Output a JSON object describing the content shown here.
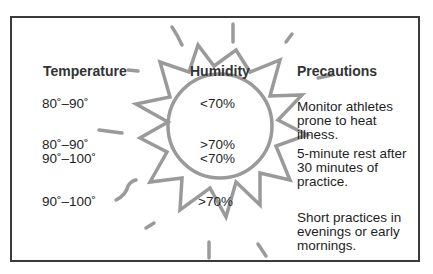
{
  "headers": {
    "temperature": "Temperature",
    "humidity": "Humidity",
    "precautions": "Precautions"
  },
  "rows": [
    {
      "temperature": [
        "80˚–90˚"
      ],
      "humidity": [
        "<70%"
      ],
      "precaution": [
        "Monitor athletes",
        "prone to heat",
        "illness."
      ]
    },
    {
      "temperature": [
        "80˚–90˚",
        "90˚–100˚"
      ],
      "humidity": [
        ">70%",
        "<70%"
      ],
      "precaution": [
        "5-minute rest after",
        "30 minutes of",
        "practice."
      ]
    },
    {
      "temperature": [
        "90˚–100˚"
      ],
      "humidity": [
        ">70%"
      ],
      "precaution": [
        "Short practices in",
        "evenings or early",
        "mornings."
      ]
    }
  ],
  "decoration": {
    "icon": "sun-icon",
    "stroke_color": "#9a9a9a",
    "border_color": "#3a3a3a"
  }
}
